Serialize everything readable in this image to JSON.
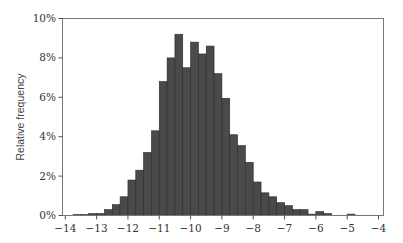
{
  "chart_data": {
    "type": "bar",
    "subtype": "histogram",
    "title": "",
    "xlabel": "",
    "ylabel": "Relative frequency",
    "xlim": [
      -14,
      -4
    ],
    "ylim": [
      0,
      10
    ],
    "x_ticks": [
      -14,
      -13,
      -12,
      -11,
      -10,
      -9,
      -8,
      -7,
      -6,
      -5,
      -4
    ],
    "x_tick_labels": [
      "−14",
      "−13",
      "−12",
      "−11",
      "−10",
      "−9",
      "−8",
      "−7",
      "−6",
      "−5",
      "−4"
    ],
    "y_ticks": [
      0,
      2,
      4,
      6,
      8,
      10
    ],
    "y_tick_labels": [
      "0%",
      "2%",
      "4%",
      "6%",
      "8%",
      "10%"
    ],
    "bin_width": 0.25,
    "grid": false,
    "legend": null,
    "bar_color": "#4a4a4a",
    "bins": [
      {
        "x0": -13.75,
        "x1": -13.5,
        "value": 0.05
      },
      {
        "x0": -13.5,
        "x1": -13.25,
        "value": 0.05
      },
      {
        "x0": -13.25,
        "x1": -13.0,
        "value": 0.1
      },
      {
        "x0": -13.0,
        "x1": -12.75,
        "value": 0.1
      },
      {
        "x0": -12.75,
        "x1": -12.5,
        "value": 0.3
      },
      {
        "x0": -12.5,
        "x1": -12.25,
        "value": 0.55
      },
      {
        "x0": -12.25,
        "x1": -12.0,
        "value": 0.95
      },
      {
        "x0": -12.0,
        "x1": -11.75,
        "value": 1.8
      },
      {
        "x0": -11.75,
        "x1": -11.5,
        "value": 2.3
      },
      {
        "x0": -11.5,
        "x1": -11.25,
        "value": 3.2
      },
      {
        "x0": -11.25,
        "x1": -11.0,
        "value": 4.3
      },
      {
        "x0": -11.0,
        "x1": -10.75,
        "value": 6.8
      },
      {
        "x0": -10.75,
        "x1": -10.5,
        "value": 8.0
      },
      {
        "x0": -10.5,
        "x1": -10.25,
        "value": 9.2
      },
      {
        "x0": -10.25,
        "x1": -10.0,
        "value": 7.5
      },
      {
        "x0": -10.0,
        "x1": -9.75,
        "value": 8.8
      },
      {
        "x0": -9.75,
        "x1": -9.5,
        "value": 8.2
      },
      {
        "x0": -9.5,
        "x1": -9.25,
        "value": 8.6
      },
      {
        "x0": -9.25,
        "x1": -9.0,
        "value": 7.2
      },
      {
        "x0": -9.0,
        "x1": -8.75,
        "value": 5.95
      },
      {
        "x0": -8.75,
        "x1": -8.5,
        "value": 4.1
      },
      {
        "x0": -8.5,
        "x1": -8.25,
        "value": 3.55
      },
      {
        "x0": -8.25,
        "x1": -8.0,
        "value": 2.7
      },
      {
        "x0": -8.0,
        "x1": -7.75,
        "value": 1.7
      },
      {
        "x0": -7.75,
        "x1": -7.5,
        "value": 1.15
      },
      {
        "x0": -7.5,
        "x1": -7.25,
        "value": 0.95
      },
      {
        "x0": -7.25,
        "x1": -7.0,
        "value": 0.65
      },
      {
        "x0": -7.0,
        "x1": -6.75,
        "value": 0.5
      },
      {
        "x0": -6.75,
        "x1": -6.5,
        "value": 0.3
      },
      {
        "x0": -6.5,
        "x1": -6.25,
        "value": 0.3
      },
      {
        "x0": -6.25,
        "x1": -6.0,
        "value": 0.07
      },
      {
        "x0": -6.0,
        "x1": -5.75,
        "value": 0.2
      },
      {
        "x0": -5.75,
        "x1": -5.5,
        "value": 0.1
      },
      {
        "x0": -5.5,
        "x1": -5.25,
        "value": 0.0
      },
      {
        "x0": -5.25,
        "x1": -5.0,
        "value": 0.0
      },
      {
        "x0": -5.0,
        "x1": -4.75,
        "value": 0.07
      }
    ]
  }
}
